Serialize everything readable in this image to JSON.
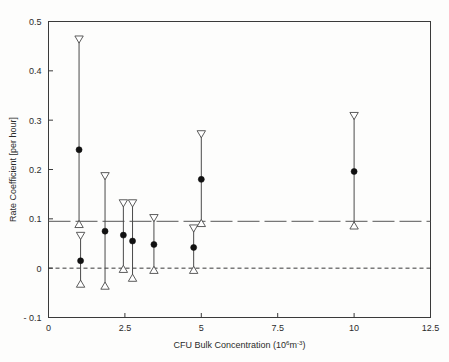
{
  "chart_data": {
    "type": "scatter",
    "title": "",
    "xlabel": "CFU Bulk Concentration (10^6 m^-3)",
    "xlabel_parts": {
      "main": "CFU Bulk Concentration (10",
      "exp1": "6",
      "mid": "m",
      "exp2": "-3",
      "tail": ")"
    },
    "ylabel": "Rate Coefficient [per hour]",
    "xlim": [
      0,
      12.5
    ],
    "ylim": [
      -0.1,
      0.5
    ],
    "xticks": [
      0,
      2.5,
      5,
      7.5,
      10,
      12.5
    ],
    "xtick_labels": [
      "0",
      "2.5",
      "5",
      "7.5",
      "10",
      "12.5"
    ],
    "yticks": [
      -0.1,
      0,
      0.1,
      0.2,
      0.3,
      0.4,
      0.5
    ],
    "ytick_labels": [
      "- 0.1",
      "0",
      "0.1",
      "0.2",
      "0.3",
      "0.4",
      "0.5"
    ],
    "grid": false,
    "legend": "none",
    "marker": "filled-circle",
    "error_cap_upper": "open-down-triangle",
    "error_cap_lower": "open-up-triangle",
    "reference_lines": [
      {
        "name": "mean-rate-line",
        "y": 0.095,
        "style": "dash-dot",
        "color": "#555555"
      },
      {
        "name": "zero-line",
        "y": 0.0,
        "style": "dashed",
        "color": "#222222"
      }
    ],
    "points": [
      {
        "x": 1.0,
        "y": 0.24,
        "err_low": 0.093,
        "err_high": 0.46
      },
      {
        "x": 1.05,
        "y": 0.015,
        "err_low": -0.028,
        "err_high": 0.062
      },
      {
        "x": 1.85,
        "y": 0.075,
        "err_low": -0.032,
        "err_high": 0.183
      },
      {
        "x": 2.45,
        "y": 0.067,
        "err_low": 0.002,
        "err_high": 0.128
      },
      {
        "x": 2.75,
        "y": 0.055,
        "err_low": -0.016,
        "err_high": 0.128
      },
      {
        "x": 3.45,
        "y": 0.048,
        "err_low": 0.0,
        "err_high": 0.098
      },
      {
        "x": 4.75,
        "y": 0.042,
        "err_low": 0.0,
        "err_high": 0.077
      },
      {
        "x": 5.0,
        "y": 0.18,
        "err_low": 0.095,
        "err_high": 0.268
      },
      {
        "x": 10.0,
        "y": 0.196,
        "err_low": 0.09,
        "err_high": 0.305
      }
    ]
  }
}
